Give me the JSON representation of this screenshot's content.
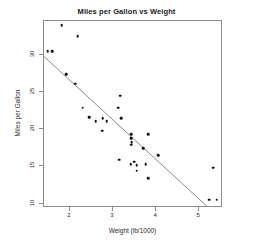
{
  "chart_data": {
    "type": "scatter",
    "title": "Miles per Gallon vs Weight",
    "xlabel": "Weight (lb/1000)",
    "ylabel": "Miles per Gallon",
    "xlim": [
      1.4,
      5.55
    ],
    "ylim": [
      9.4,
      34.6
    ],
    "xticks": [
      2,
      3,
      4,
      5
    ],
    "xtick_labels": [
      "2",
      "3",
      "4",
      "5"
    ],
    "yticks": [
      10,
      15,
      20,
      25,
      30
    ],
    "ytick_labels": [
      "10",
      "15",
      "20",
      "25",
      "30"
    ],
    "grid": false,
    "legend": null,
    "point_color": "#111111",
    "line_color": "#8c8c8c",
    "frame_color": "#8c8c8c",
    "series": [
      {
        "name": "mtcars",
        "x": [
          2.62,
          2.875,
          2.32,
          3.215,
          3.44,
          3.46,
          3.57,
          3.19,
          3.15,
          3.44,
          3.44,
          4.07,
          3.73,
          3.78,
          5.25,
          5.424,
          5.345,
          2.2,
          1.615,
          1.835,
          2.465,
          3.52,
          3.435,
          3.84,
          3.845,
          1.935,
          2.14,
          1.513,
          3.17,
          2.77,
          3.57,
          2.78
        ],
        "y": [
          21.0,
          21.0,
          22.8,
          21.4,
          18.7,
          18.1,
          14.3,
          24.4,
          22.8,
          19.2,
          17.8,
          16.4,
          17.3,
          15.2,
          10.4,
          10.4,
          14.7,
          32.4,
          30.4,
          33.9,
          21.5,
          15.5,
          15.2,
          13.3,
          19.2,
          27.3,
          26.0,
          30.4,
          15.8,
          19.7,
          15.0,
          21.4
        ]
      }
    ],
    "fit_line": {
      "type": "linear",
      "intercept": 37.2851,
      "slope": -5.3445,
      "x_start": 1.4,
      "x_end": 5.2
    }
  }
}
